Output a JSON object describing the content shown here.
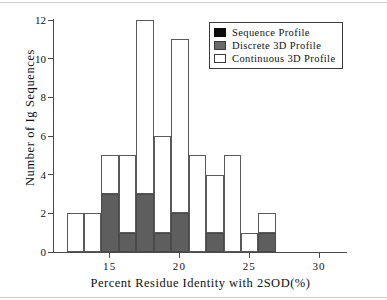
{
  "chart_data": {
    "type": "bar",
    "subtype": "stacked-histogram",
    "title": "",
    "xlabel": "Percent  Residue  Identity  with  2SOD(%)",
    "ylabel": "Number of Ig Sequences",
    "xlim": [
      11.0,
      32.0
    ],
    "ylim": [
      0,
      12
    ],
    "xticks": [
      15,
      20,
      25,
      30
    ],
    "xtick_labels": [
      "15",
      "20",
      "25",
      "30"
    ],
    "yticks": [
      0,
      2,
      4,
      6,
      8,
      10,
      12
    ],
    "ytick_labels": [
      "0",
      "2",
      "4",
      "6",
      "8",
      "10",
      "12"
    ],
    "grid": false,
    "bin_width": 1.25,
    "bin_starts": [
      11.9,
      13.15,
      14.4,
      15.65,
      16.9,
      18.15,
      19.4,
      20.65,
      21.9,
      23.15,
      24.4,
      25.65
    ],
    "legend_position": "top-right",
    "series": [
      {
        "name": "Sequence  Profile",
        "color": "#0c0c0c",
        "values": [
          0,
          0,
          0,
          0,
          0,
          0,
          0,
          0,
          0,
          0,
          0,
          0
        ]
      },
      {
        "name": "Discrete  3D  Profile",
        "color": "#5e5e5e",
        "values": [
          0,
          0,
          3,
          1,
          3,
          1,
          2,
          0,
          1,
          0,
          0,
          1
        ]
      },
      {
        "name": "Continuous  3D  Profile",
        "color": "#ffffff",
        "values": [
          2,
          2,
          2,
          4,
          9,
          5,
          9,
          5,
          3,
          5,
          1,
          1
        ]
      }
    ],
    "bar_totals": [
      2,
      2,
      5,
      5,
      12,
      6,
      11,
      5,
      4,
      5,
      1,
      2
    ],
    "annotations": []
  },
  "legend": {
    "items": [
      {
        "label": "Sequence  Profile",
        "swatch": "sequence"
      },
      {
        "label": "Discrete  3D  Profile",
        "swatch": "discrete"
      },
      {
        "label": "Continuous  3D  Profile",
        "swatch": "continuous"
      }
    ]
  }
}
